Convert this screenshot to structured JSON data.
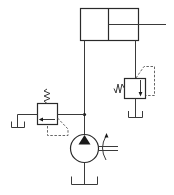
{
  "diagram": {
    "type": "hydraulic-schematic",
    "colors": {
      "line": "#3a3a3a",
      "background": "#ffffff",
      "pilot": "#555555"
    },
    "components": [
      {
        "id": "cylinder",
        "label": "Double-acting cylinder with single rod"
      },
      {
        "id": "relief-valve-right",
        "label": "Pressure relief valve (spring, pilot)"
      },
      {
        "id": "relief-valve-left",
        "label": "Pressure relief valve (spring, pilot)"
      },
      {
        "id": "pump",
        "label": "Fixed displacement pump with drive shaft"
      },
      {
        "id": "tank-pump",
        "label": "Tank"
      },
      {
        "id": "tank-left",
        "label": "Tank"
      },
      {
        "id": "tank-right",
        "label": "Tank"
      },
      {
        "id": "junction",
        "label": "Line junction"
      }
    ]
  }
}
